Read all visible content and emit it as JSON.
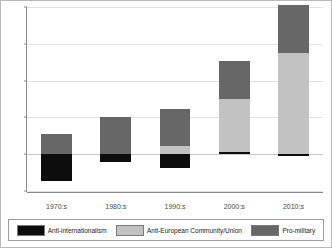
{
  "chart_data": {
    "type": "bar",
    "stacked": true,
    "title": "",
    "xlabel": "",
    "ylabel": "",
    "categories": [
      "1970:s",
      "1980:s",
      "1990:s",
      "2000:s",
      "2010:s"
    ],
    "series": [
      {
        "name": "Anti-internationalism",
        "color": "#0d0d0d",
        "values": [
          -1.45,
          -0.4,
          -0.75,
          0.1,
          -0.1
        ]
      },
      {
        "name": "Anti-European Community/Union",
        "color": "#c2c2c2",
        "values": [
          0,
          0,
          0.45,
          2.9,
          5.5
        ]
      },
      {
        "name": "Pro-military",
        "color": "#676767",
        "values": [
          1.1,
          2.0,
          2.0,
          2.05,
          2.6
        ]
      }
    ],
    "ylim": [
      -2,
      8
    ],
    "yticks": [
      -2,
      0,
      2,
      4,
      6,
      8
    ],
    "ytick_labels": [
      "-2",
      "0",
      "2",
      "4",
      "6",
      "8"
    ],
    "grid": true,
    "legend_position": "bottom"
  },
  "colors": {
    "frame": "#b9b9b9",
    "axis": "#8a8a8a",
    "grid": "#e2e2e2",
    "background": "#ffffff"
  }
}
